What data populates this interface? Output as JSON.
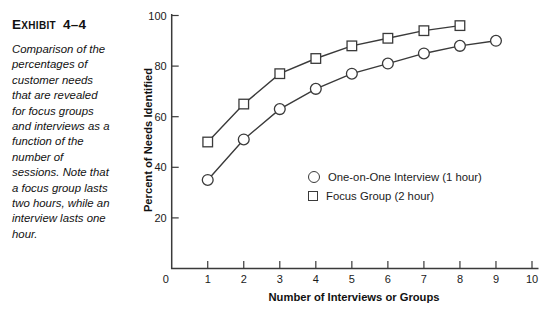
{
  "exhibit": {
    "label_initial": "E",
    "label_small": "XHIBIT",
    "number": "4–4",
    "caption_lines": [
      "Comparison of the",
      "percentages of",
      "customer needs",
      "that are revealed",
      "for focus groups",
      "and interviews as a",
      "function of the",
      "number of",
      "sessions. Note that",
      "a focus group lasts",
      "two hours, while an",
      "interview lasts one",
      "hour."
    ]
  },
  "chart_data": {
    "type": "line",
    "title": "",
    "xlabel": "Number of Interviews or Groups",
    "ylabel": "Percent of Needs Identified",
    "xlim": [
      0,
      10
    ],
    "ylim": [
      0,
      100
    ],
    "x_ticks": [
      0,
      1,
      2,
      3,
      4,
      5,
      6,
      7,
      8,
      9,
      10
    ],
    "y_ticks": [
      20,
      40,
      60,
      80,
      100
    ],
    "grid": false,
    "legend_position": "inside-lower-right",
    "series": [
      {
        "name": "One-on-One Interview (1 hour)",
        "marker": "circle",
        "x": [
          1,
          2,
          3,
          4,
          5,
          6,
          7,
          8,
          9
        ],
        "values": [
          35,
          51,
          63,
          71,
          77,
          81,
          85,
          88,
          90
        ]
      },
      {
        "name": "Focus Group (2 hour)",
        "marker": "square",
        "x": [
          1,
          2,
          3,
          4,
          5,
          6,
          7,
          8
        ],
        "values": [
          50,
          65,
          77,
          83,
          88,
          91,
          94,
          96
        ]
      }
    ]
  },
  "colors": {
    "line": "#3a3a3a",
    "text": "#1a1a1a",
    "background": "#ffffff"
  }
}
